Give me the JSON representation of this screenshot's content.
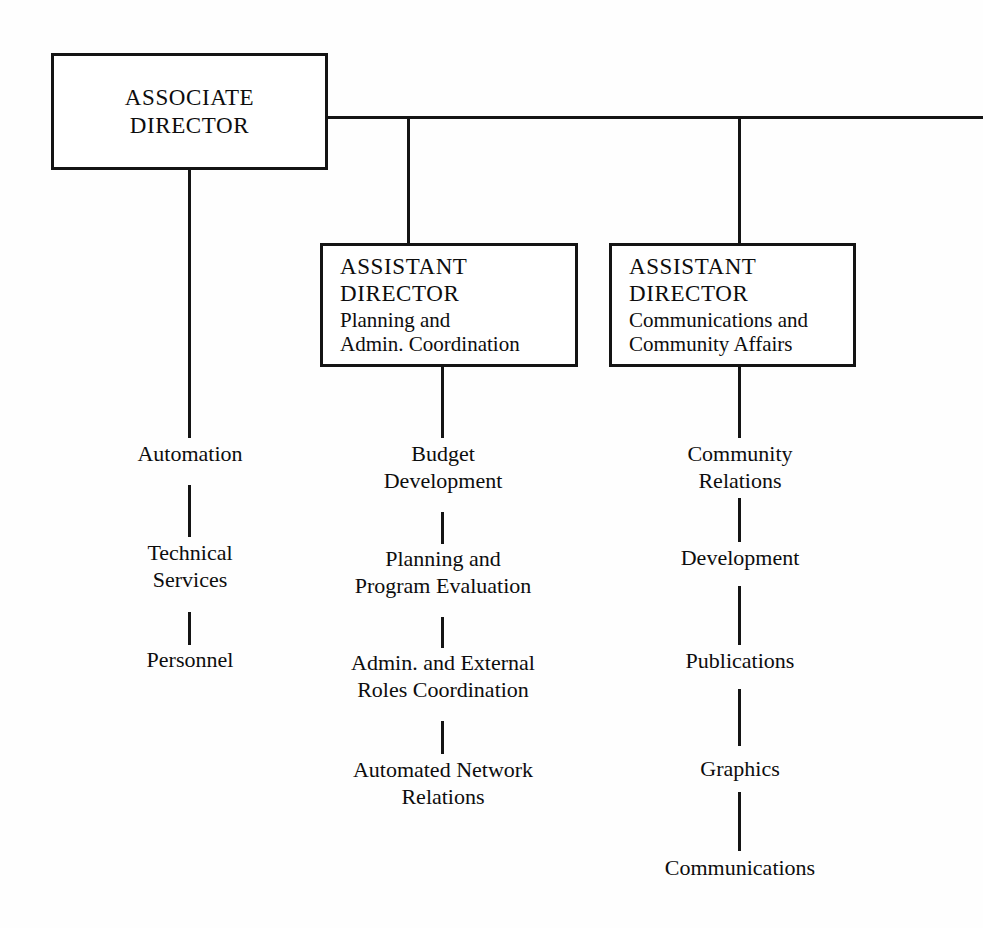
{
  "chart": {
    "type": "organization-chart",
    "background_color": "#fefefe",
    "line_color": "#141414",
    "text_color": "#0d0d0d"
  },
  "boxes": {
    "associate_director": {
      "title_line_1": "ASSOCIATE",
      "title_line_2": "DIRECTOR"
    },
    "assistant_director_planning": {
      "title_line_1": "ASSISTANT",
      "title_line_2": "DIRECTOR",
      "sub_line_1": "Planning and",
      "sub_line_2": "Admin. Coordination"
    },
    "assistant_director_communications": {
      "title_line_1": "ASSISTANT",
      "title_line_2": "DIRECTOR",
      "sub_line_1": "Communications and",
      "sub_line_2": "Community Affairs"
    }
  },
  "columns": {
    "automation_branch": [
      {
        "line_1": "Automation",
        "line_2": ""
      },
      {
        "line_1": "Technical",
        "line_2": "Services"
      },
      {
        "line_1": "Personnel",
        "line_2": ""
      }
    ],
    "planning_branch": [
      {
        "line_1": "Budget",
        "line_2": "Development"
      },
      {
        "line_1": "Planning and",
        "line_2": "Program Evaluation"
      },
      {
        "line_1": "Admin. and External",
        "line_2": "Roles Coordination"
      },
      {
        "line_1": "Automated Network",
        "line_2": "Relations"
      }
    ],
    "communications_branch": [
      {
        "line_1": "Community",
        "line_2": "Relations"
      },
      {
        "line_1": "Development",
        "line_2": ""
      },
      {
        "line_1": "Publications",
        "line_2": ""
      },
      {
        "line_1": "Graphics",
        "line_2": ""
      },
      {
        "line_1": "Communications",
        "line_2": ""
      }
    ]
  }
}
